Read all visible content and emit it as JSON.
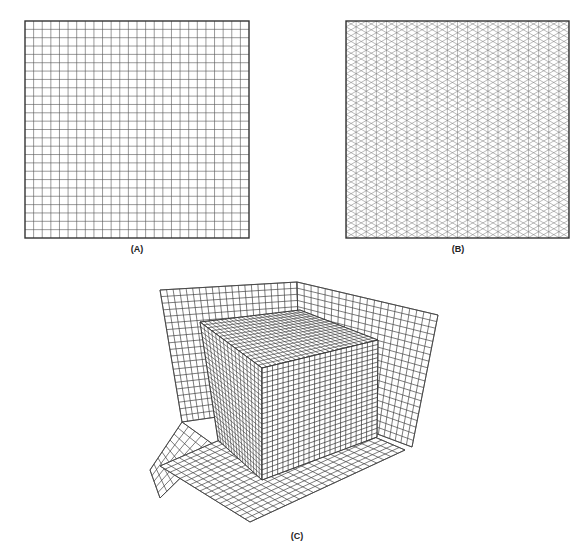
{
  "panels": [
    {
      "id": "A",
      "label": "(A)",
      "type": "square-grid",
      "x": 25,
      "y": 21,
      "w": 224,
      "h": 217,
      "cells": 26,
      "label_x": 137,
      "label_y": 244
    },
    {
      "id": "B",
      "label": "(B)",
      "type": "triangular-grid",
      "x": 346,
      "y": 21,
      "w": 223,
      "h": 217,
      "cols": 22,
      "label_x": 458,
      "label_y": 244
    },
    {
      "id": "C",
      "label": "(C)",
      "type": "3d-hex-mesh-box-in-corner",
      "label_x": 297,
      "label_y": 535
    }
  ],
  "colors": {
    "grid_line": "#555555",
    "border": "#333333",
    "background": "#ffffff"
  }
}
